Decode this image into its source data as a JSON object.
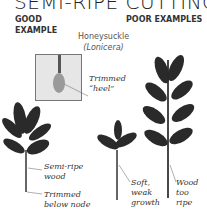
{
  "title": "SEMI-RIPE CUTTINGS",
  "sections": {
    "good": "GOOD EXAMPLE",
    "poor": "POOR EXAMPLES"
  },
  "species": {
    "common_name": "Honeysuckle",
    "latin_name": "(Lonicera)"
  },
  "annotations": {
    "heel_line1": "Trimmed",
    "heel_line2": "“heel”",
    "semi_line1": "Semi-ripe",
    "semi_line2": "wood",
    "trim_line1": "Trimmed",
    "trim_line2": "below node",
    "soft_line1": "Soft,",
    "soft_line2": "weak",
    "soft_line3": "growth",
    "ripe_line1": "Wood",
    "ripe_line2": "too",
    "ripe_line3": "ripe"
  },
  "colors": {
    "leaf": "#2a2a2a",
    "stem": "#333333",
    "inset_bg": "#e6e6e6"
  }
}
